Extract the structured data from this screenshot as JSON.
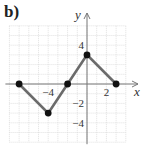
{
  "panel": {
    "label": "b)"
  },
  "axes": {
    "x_label": "x",
    "y_label": "y",
    "x_ticks": [
      {
        "value": -4,
        "label": "−4"
      },
      {
        "value": 2,
        "label": "2"
      }
    ],
    "y_ticks": [
      {
        "value": 4,
        "label": "4"
      },
      {
        "value": -2,
        "label": "−2"
      },
      {
        "value": -4,
        "label": "−4"
      }
    ]
  },
  "colors": {
    "line": "#6b6b6b",
    "point": "#111111",
    "grid": "#d9d9d9",
    "axis": "#777777"
  },
  "chart_data": {
    "type": "line",
    "title": "b)",
    "xlabel": "x",
    "ylabel": "y",
    "x": [
      -7,
      -4,
      -2,
      0,
      3
    ],
    "y": [
      0,
      -3,
      0,
      3,
      0
    ],
    "series": [
      {
        "name": "piecewise linear graph",
        "points": [
          [
            -7,
            0
          ],
          [
            -4,
            -3
          ],
          [
            -2,
            0
          ],
          [
            0,
            3
          ],
          [
            3,
            0
          ]
        ]
      }
    ],
    "xlim": [
      -8,
      4
    ],
    "ylim": [
      -6,
      6
    ],
    "grid": true,
    "x_tick_labels": [
      "-4",
      "2"
    ],
    "y_tick_labels": [
      "4",
      "-2",
      "-4"
    ],
    "legend": null
  }
}
